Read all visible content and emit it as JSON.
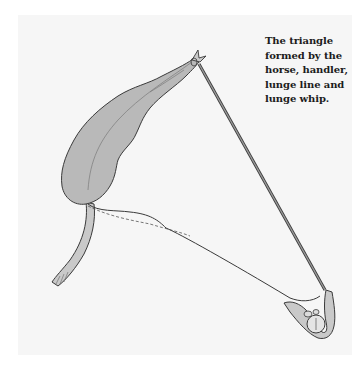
{
  "figure": {
    "caption_lines": [
      "The triangle",
      "formed by the",
      "horse, handler,",
      "lunge line and",
      "lunge whip."
    ],
    "elements": {
      "horse": "horse-top-view",
      "handler": "handler-top-view",
      "lunge_line": "lunge-line",
      "lunge_whip": "lunge-whip"
    },
    "colors": {
      "panel": "#f6f6f6",
      "horse_fill": "#b9b9b9",
      "outline": "#3a3a3a",
      "whip": "#8c8c8c",
      "caption": "#1c1c1c"
    }
  }
}
